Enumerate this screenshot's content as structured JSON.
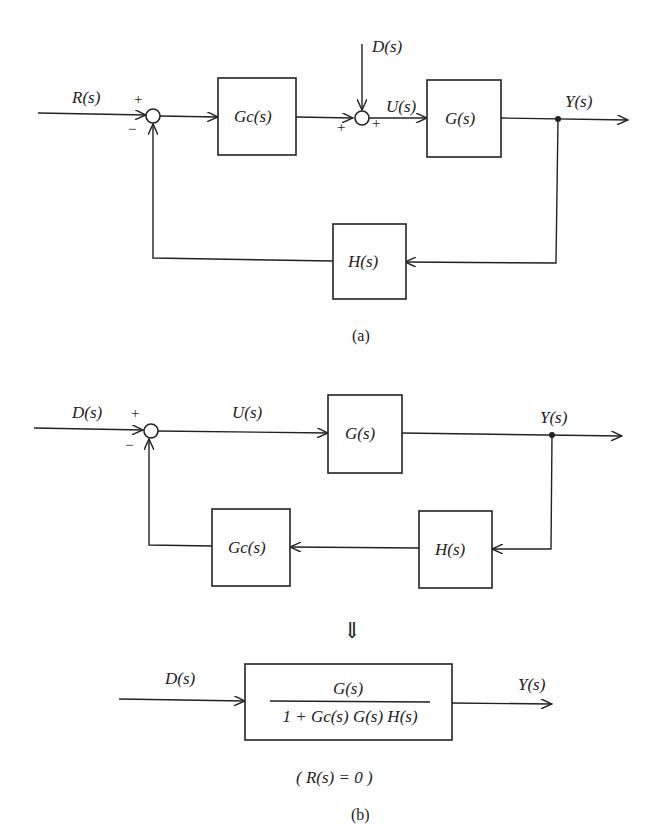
{
  "header": {
    "title": ""
  },
  "diagram_a": {
    "caption": "(a)",
    "signals": {
      "input": "R(s)",
      "disturbance": "D(s)",
      "control": "U(s)",
      "output": "Y(s)"
    },
    "blocks": {
      "controller": "Gc(s)",
      "plant": "G(s)",
      "feedback": "H(s)"
    },
    "junction1_signs": {
      "top": "+",
      "bottom": "−"
    },
    "junction2_signs": {
      "left": "+",
      "top": "+"
    }
  },
  "diagram_b": {
    "caption": "(b)",
    "signals": {
      "input": "D(s)",
      "control": "U(s)",
      "output": "Y(s)"
    },
    "blocks": {
      "plant": "G(s)",
      "sensor": "H(s)",
      "controller": "Gc(s)"
    },
    "junction_signs": {
      "top": "+",
      "bottom": "−"
    },
    "transform_arrow": "⇓",
    "reduced": {
      "input": "D(s)",
      "output": "Y(s)",
      "numerator": "G(s)",
      "denominator": "1 + Gc(s) G(s) H(s)"
    },
    "condition": "( R(s) = 0 )"
  }
}
